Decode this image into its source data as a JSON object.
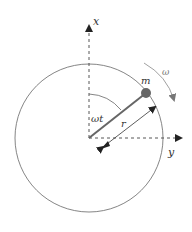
{
  "diagram": {
    "title": "",
    "labels": {
      "x_axis": "x",
      "y_axis": "y",
      "mass": "m",
      "angular_velocity": "ω",
      "angle": "ωt",
      "radius": "r"
    },
    "colors": {
      "line": "#555555",
      "rod": "#666666",
      "mass": "#666666",
      "circle": "#666666",
      "text": "#333333",
      "omega_arrow": "#888888"
    }
  }
}
